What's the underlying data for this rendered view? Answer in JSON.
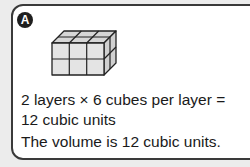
{
  "badge": {
    "label": "A"
  },
  "figure": {
    "layers": 2,
    "cubes_per_layer": 6,
    "rows": 2,
    "cols": 3
  },
  "text": {
    "line1": "2 layers × 6 cubes per layer =",
    "line2": "12 cubic units",
    "line3": "The volume is 12 cubic units."
  }
}
